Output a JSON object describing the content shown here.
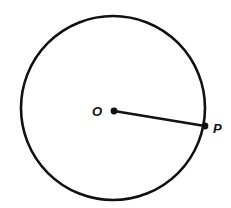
{
  "diagram": {
    "type": "geometry",
    "stroke_color": "#111111",
    "background": "#ffffff",
    "circle": {
      "cx": 113,
      "cy": 108,
      "r": 92
    },
    "points": [
      {
        "id": "O",
        "label": "O",
        "x": 114,
        "y": 111
      },
      {
        "id": "P",
        "label": "P",
        "x": 205,
        "y": 126
      }
    ],
    "segments": [
      {
        "from": "O",
        "to": "P",
        "label": "radius"
      }
    ]
  }
}
